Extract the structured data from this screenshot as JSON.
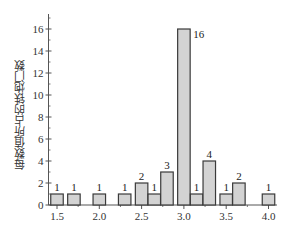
{
  "chart_data": {
    "type": "bar",
    "title": "",
    "xlabel": "",
    "ylabel": "每数值所占的铁炮门数",
    "x": [
      1.5,
      1.7,
      2.0,
      2.3,
      2.5,
      2.65,
      2.8,
      3.0,
      3.15,
      3.3,
      3.5,
      3.65,
      4.0
    ],
    "values": [
      1,
      1,
      1,
      1,
      2,
      1,
      3,
      16,
      1,
      4,
      1,
      2,
      1
    ],
    "data_labels": [
      "1",
      "1",
      "1",
      "1",
      "2",
      "1",
      "3",
      "16",
      "1",
      "4",
      "1",
      "2",
      "1"
    ],
    "xticks": [
      "1.5",
      "2.0",
      "2.5",
      "3.0",
      "3.5",
      "4.0"
    ],
    "yticks": [
      "0",
      "2",
      "4",
      "6",
      "8",
      "10",
      "12",
      "14",
      "16"
    ],
    "xlim": [
      1.4,
      4.1
    ],
    "ylim": [
      0,
      17
    ],
    "grid": false,
    "legend": null,
    "colors": {
      "bar_fill": "#d3d3d3",
      "bar_stroke": "#3a3a3a",
      "axis": "#555555"
    }
  }
}
